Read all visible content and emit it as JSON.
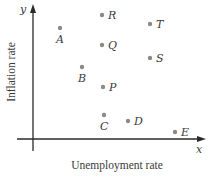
{
  "chart_data": {
    "type": "scatter",
    "title": "",
    "xlabel": "Unemployment rate",
    "ylabel": "Inflation rate",
    "x_axis_symbol": "x",
    "y_axis_symbol": "y",
    "grid": false,
    "legend": null,
    "ticks": "none",
    "points": [
      {
        "label": "A",
        "x": 27,
        "y": 111,
        "label_pos": "below"
      },
      {
        "label": "R",
        "x": 69,
        "y": 124,
        "label_pos": "right"
      },
      {
        "label": "Q",
        "x": 69,
        "y": 94,
        "label_pos": "right"
      },
      {
        "label": "T",
        "x": 117,
        "y": 115,
        "label_pos": "right"
      },
      {
        "label": "S",
        "x": 117,
        "y": 81,
        "label_pos": "right"
      },
      {
        "label": "B",
        "x": 49,
        "y": 72,
        "label_pos": "below"
      },
      {
        "label": "P",
        "x": 70,
        "y": 52,
        "label_pos": "right"
      },
      {
        "label": "C",
        "x": 71,
        "y": 24,
        "label_pos": "below"
      },
      {
        "label": "D",
        "x": 95,
        "y": 18,
        "label_pos": "right"
      },
      {
        "label": "E",
        "x": 142,
        "y": 7,
        "label_pos": "right"
      }
    ],
    "note": "Coordinates are in relative units measured from the axes origin (no numeric ticks shown)"
  },
  "colors": {
    "point": "#8a8a8a",
    "axis": "#2a2a2a",
    "text": "#3a3a3a"
  }
}
